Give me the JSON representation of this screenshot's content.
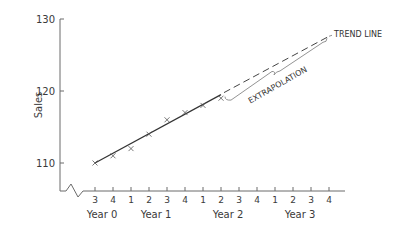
{
  "chart_data": {
    "type": "scatter",
    "title": "",
    "xlabel": "",
    "ylabel": "Sales",
    "ylim": [
      105,
      130
    ],
    "yticks": [
      110,
      120,
      130
    ],
    "y_axis_break": true,
    "grid": false,
    "quarter_ticks": [
      "3",
      "4",
      "1",
      "2",
      "3",
      "4",
      "1",
      "2",
      "3",
      "4",
      "1",
      "2",
      "3",
      "4"
    ],
    "year_labels": [
      {
        "label": "Year 0",
        "center_tick": 0.5
      },
      {
        "label": "Year 1",
        "center_tick": 3.5
      },
      {
        "label": "Year 2",
        "center_tick": 7.5
      },
      {
        "label": "Year 3",
        "center_tick": 11.5
      }
    ],
    "series": [
      {
        "name": "Sales (observed)",
        "marker": "x",
        "x": [
          0,
          1,
          2,
          3,
          4,
          5,
          6,
          7
        ],
        "values": [
          110,
          111,
          112,
          114,
          116,
          117,
          118,
          119
        ]
      }
    ],
    "trend_line": {
      "solid": {
        "x": [
          0,
          7
        ],
        "values": [
          110,
          119.5
        ]
      },
      "dashed": {
        "x": [
          7,
          13
        ],
        "values": [
          119.5,
          127.6
        ]
      }
    },
    "annotations": [
      {
        "text": "TREND LINE",
        "target": "dashed-line-end"
      },
      {
        "text": "EXTRAPOLATION",
        "target": "brace-under-dashed-line"
      }
    ]
  }
}
